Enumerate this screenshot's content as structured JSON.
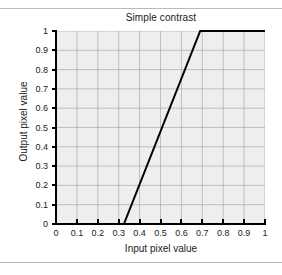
{
  "figure": {
    "background_color": "#ffffff",
    "rule_color": "#b9b9b9"
  },
  "chart_data": {
    "type": "line",
    "title": "Simple contrast",
    "xlabel": "Input pixel value",
    "ylabel": "Output pixel value",
    "xlim": [
      0,
      1
    ],
    "ylim": [
      0,
      1
    ],
    "grid": true,
    "legend": null,
    "plot_background": "#eeeeee",
    "grid_color": "#9aa0a6",
    "line_color": "#000000",
    "line_width": 2,
    "xticks": [
      0,
      0.1,
      0.2,
      0.3,
      0.4,
      0.5,
      0.6,
      0.7,
      0.8,
      0.9,
      1
    ],
    "yticks": [
      0,
      0.1,
      0.2,
      0.3,
      0.4,
      0.5,
      0.6,
      0.7,
      0.8,
      0.9,
      1
    ],
    "xticklabels": [
      "0",
      "0.1",
      "0.2",
      "0.3",
      "0.4",
      "0.5",
      "0.6",
      "0.7",
      "0.8",
      "0.9",
      "1"
    ],
    "yticklabels": [
      "0",
      "0.1",
      "0.2",
      "0.3",
      "0.4",
      "0.5",
      "0.6",
      "0.7",
      "0.8",
      "0.9",
      "1"
    ],
    "series": [
      {
        "name": "contrast transfer function",
        "x": [
          0,
          0.325,
          0.69,
          1
        ],
        "y": [
          0,
          0,
          1,
          1
        ]
      }
    ],
    "annotations": [
      {
        "text": "flat at output 0 until input 0.325"
      },
      {
        "text": "linear ramp from input 0.325 to 0.69"
      },
      {
        "text": "saturated at output 1 from input 0.69 to 1"
      }
    ]
  }
}
